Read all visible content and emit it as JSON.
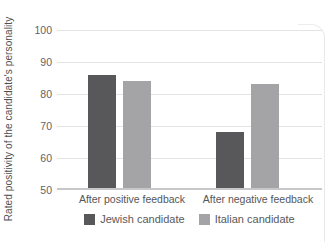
{
  "chart_data": {
    "type": "bar",
    "title": "",
    "categories": [
      "After positive feedback",
      "After negative feedback"
    ],
    "series": [
      {
        "name": "Jewish candidate",
        "color": "#58585a",
        "values": [
          86,
          68
        ]
      },
      {
        "name": "Italian candidate",
        "color": "#a4a4a6",
        "values": [
          84,
          83
        ]
      }
    ],
    "xlabel": "",
    "ylabel": "Rated positivity of the candidate's personality",
    "ylim": [
      50,
      100
    ],
    "yticks": [
      50,
      60,
      70,
      80,
      90,
      100
    ],
    "grid": true,
    "legend_position": "bottom",
    "colors": {
      "gridline": "#e3e3e3",
      "axis_line": "#c7c7c9",
      "text": "#58585a"
    }
  }
}
